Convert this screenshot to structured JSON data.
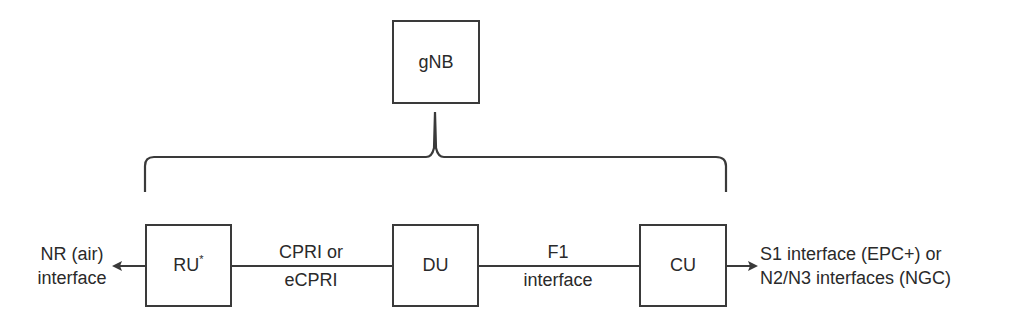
{
  "diagram": {
    "top_node": {
      "label": "gNB"
    },
    "nodes": [
      {
        "id": "ru",
        "label": "RU",
        "superscript": "*"
      },
      {
        "id": "du",
        "label": "DU"
      },
      {
        "id": "cu",
        "label": "CU"
      }
    ],
    "links": [
      {
        "from": "ru",
        "to": "du",
        "label_line1": "CPRI or",
        "label_line2": "eCPRI"
      },
      {
        "from": "du",
        "to": "cu",
        "label_line1": "F1",
        "label_line2": "interface"
      }
    ],
    "left_endpoint": {
      "label_line1": "NR (air)",
      "label_line2": "interface",
      "arrow": "left"
    },
    "right_endpoint": {
      "label_line1": "S1 interface (EPC+) or",
      "label_line2": "N2/N3 interfaces (NGC)",
      "arrow": "right"
    },
    "grouping": {
      "type": "curly-brace",
      "groups": [
        "ru",
        "du",
        "cu"
      ],
      "under": "gNB"
    },
    "colors": {
      "stroke": "#3a3a3a",
      "text": "#2a2a2a",
      "background": "#ffffff"
    }
  }
}
